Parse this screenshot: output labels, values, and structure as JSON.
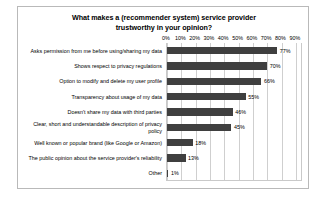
{
  "chart_data": {
    "type": "bar",
    "orientation": "horizontal",
    "title": "What makes a (recommender system) service provider trustworthy in your opinion?",
    "title_lines": [
      "What makes a (recommender system) service provider",
      "trustworthy in your opinion?"
    ],
    "xlabel": "",
    "ylabel": "",
    "xlim": [
      0,
      95
    ],
    "tick_labels": [
      "0%",
      "10%",
      "20%",
      "30%",
      "40%",
      "50%",
      "60%",
      "70%",
      "80%",
      "90%"
    ],
    "tick_values": [
      0,
      10,
      20,
      30,
      40,
      50,
      60,
      70,
      80,
      90
    ],
    "grid": true,
    "legend": false,
    "bar_color": "#3f3f3f",
    "categories": [
      "Asks permission from me before using/sharing my data",
      "Shows respect to privacy regulations",
      "Option to modify and delete my user profile",
      "Transparency about usage of my data",
      "Doesn't share my data with third parties",
      "Clear, short and understandable description of privacy policy",
      "Well known or popular brand (like Google or Amazon)",
      "The public opinion about the service provider's reliability",
      "Other"
    ],
    "values": [
      77,
      70,
      66,
      55,
      46,
      45,
      18,
      13,
      1
    ],
    "value_labels": [
      "77%",
      "70%",
      "66%",
      "55%",
      "46%",
      "45%",
      "18%",
      "13%",
      "1%"
    ]
  }
}
